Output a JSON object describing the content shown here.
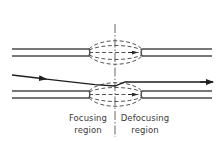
{
  "diagram": {
    "type": "physics-schematic",
    "colors": {
      "background": "#ffffff",
      "stroke": "#4a4a4a",
      "ray": "#1e1e1e",
      "text": "#3a3a3a"
    },
    "labels": {
      "focusing": {
        "line1": "Focusing",
        "line2": "region"
      },
      "defocusing": {
        "line1": "Defocusing",
        "line2": "region"
      }
    },
    "elements": {
      "top_pipe": {
        "y_upper": 49,
        "y_lower": 56,
        "left_end": 12,
        "lens_left": 89,
        "lens_right": 142,
        "right_end": 212
      },
      "bottom_pipe": {
        "y_upper": 91,
        "y_lower": 98,
        "left_end": 12,
        "lens_left": 89,
        "lens_right": 142,
        "right_end": 212
      },
      "center_axis_x": 115,
      "ray": {
        "start": [
          12,
          75
        ],
        "bend": [
          115,
          86
        ],
        "end": [
          213,
          82
        ]
      }
    }
  }
}
